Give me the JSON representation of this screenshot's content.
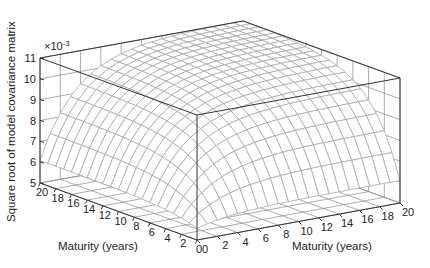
{
  "chart_data": {
    "type": "surface",
    "title": "",
    "zlabel": "Square root of model covariance matrix",
    "z_multiplier": "×10",
    "z_multiplier_exp": "-3",
    "xlabel": "Maturity (years)",
    "ylabel": "Maturity (years)",
    "zlim": [
      5,
      11
    ],
    "xlim": [
      0,
      20
    ],
    "ylim": [
      0,
      20
    ],
    "z_ticks": [
      "5",
      "6",
      "7",
      "8",
      "9",
      "10",
      "11"
    ],
    "x_ticks": [
      "0",
      "2",
      "4",
      "6",
      "8",
      "10",
      "12",
      "14",
      "16",
      "18",
      "20"
    ],
    "y_ticks": [
      "0",
      "2",
      "4",
      "6",
      "8",
      "10",
      "12",
      "14",
      "16",
      "18",
      "20"
    ],
    "grid": true,
    "samples": [
      {
        "x": 0,
        "y": 0,
        "z": 5.5
      },
      {
        "x": 20,
        "y": 0,
        "z": 5.9
      },
      {
        "x": 0,
        "y": 20,
        "z": 5.9
      },
      {
        "x": 4,
        "y": 4,
        "z": 7.7
      },
      {
        "x": 10,
        "y": 10,
        "z": 10.3
      },
      {
        "x": 20,
        "y": 20,
        "z": 11.0
      }
    ]
  }
}
